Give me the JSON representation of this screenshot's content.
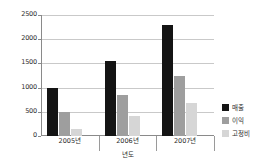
{
  "chart_data": {
    "type": "bar",
    "title": "",
    "xlabel": "년도",
    "ylabel": "",
    "categories": [
      "2005년",
      "2006년",
      "2007년"
    ],
    "series": [
      {
        "name": "매출",
        "color": "#141414",
        "values": [
          1000,
          1550,
          2290
        ]
      },
      {
        "name": "이익",
        "color": "#9e9e9e",
        "values": [
          490,
          850,
          1250
        ]
      },
      {
        "name": "고정비",
        "color": "#d6d6d6",
        "values": [
          150,
          420,
          690
        ]
      }
    ],
    "ylim": [
      0,
      2500
    ],
    "y_ticks": [
      0,
      500,
      1000,
      1500,
      2000,
      2500
    ],
    "y_tick_labels": [
      "0",
      "500",
      "1000",
      "1500",
      "2000",
      "2500"
    ],
    "grid": true,
    "legend_position": "right"
  },
  "axes": {
    "y_labels": [
      "2500",
      "2000",
      "1500",
      "1000",
      "500",
      "0"
    ],
    "x_labels": [
      "2005년",
      "2006년",
      "2007년"
    ],
    "x_title": "년도"
  },
  "legend": {
    "items": [
      {
        "label": "매출"
      },
      {
        "label": "이익"
      },
      {
        "label": "고정비"
      }
    ]
  }
}
